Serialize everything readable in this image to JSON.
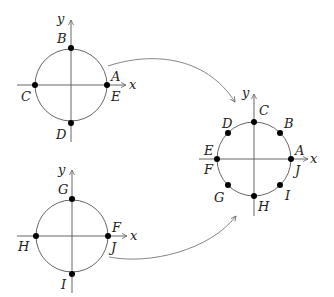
{
  "diagram": {
    "colors": {
      "axis": "#555555",
      "circle": "#666666",
      "point": "#000000",
      "arrow": "#777777"
    },
    "top_left": {
      "axis_x": "x",
      "axis_y": "y",
      "points": [
        {
          "label": "A",
          "pos": "right-upper"
        },
        {
          "label": "B",
          "pos": "top"
        },
        {
          "label": "C",
          "pos": "left"
        },
        {
          "label": "D",
          "pos": "bottom"
        },
        {
          "label": "E",
          "pos": "right-lower"
        }
      ]
    },
    "bottom_left": {
      "axis_x": "x",
      "axis_y": "y",
      "points": [
        {
          "label": "F",
          "pos": "right-upper"
        },
        {
          "label": "G",
          "pos": "top"
        },
        {
          "label": "H",
          "pos": "left"
        },
        {
          "label": "I",
          "pos": "bottom"
        },
        {
          "label": "J",
          "pos": "right-lower"
        }
      ]
    },
    "right": {
      "axis_x": "x",
      "axis_y": "y",
      "points": [
        {
          "label": "A",
          "angle": 0
        },
        {
          "label": "B",
          "angle": 45
        },
        {
          "label": "C",
          "angle": 90
        },
        {
          "label": "D",
          "angle": 135
        },
        {
          "label": "E",
          "angle": 180
        },
        {
          "label": "F",
          "angle": 180
        },
        {
          "label": "G",
          "angle": 225
        },
        {
          "label": "H",
          "angle": 270
        },
        {
          "label": "I",
          "angle": 315
        },
        {
          "label": "J",
          "angle": 360
        }
      ]
    }
  }
}
